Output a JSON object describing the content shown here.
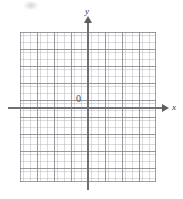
{
  "figure": {
    "type": "coordinate-plane",
    "title": "",
    "origin_label": "0",
    "x_axis_label": "x",
    "y_axis_label": "y",
    "colors": {
      "background": "#ffffff",
      "axis": "#6e6e73",
      "arrow": "#5d5d62",
      "grid_major": "#82828a",
      "grid_minor": "#aaaaaf",
      "label": "#3a3a3e"
    }
  },
  "chart_data": {
    "type": "scatter",
    "title": "",
    "subtitle": "",
    "xlabel": "x",
    "ylabel": "y",
    "origin_label": "0",
    "xlim": [
      -4,
      4
    ],
    "ylim": [
      -4.5,
      4
    ],
    "xticks": [
      -4,
      -3,
      -2,
      -1,
      0,
      1,
      2,
      3,
      4
    ],
    "yticks": [
      -4,
      -3,
      -2,
      -1,
      0,
      1,
      2,
      3,
      4
    ],
    "xtick_labels": [
      "",
      "",
      "",
      "",
      "0",
      "",
      "",
      "",
      ""
    ],
    "ytick_labels": [
      "",
      "",
      "",
      "",
      "",
      "",
      "",
      "",
      ""
    ],
    "major_grid": true,
    "minor_grid": true,
    "minor_divisions_per_major": 5,
    "grid_columns_major": 8,
    "grid_rows_major": 9,
    "legend": [],
    "series": [],
    "annotations": []
  }
}
